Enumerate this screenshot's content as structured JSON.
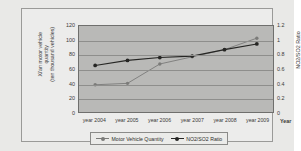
{
  "chart_data": {
    "type": "line",
    "title": "",
    "xlabel": "Year",
    "categories": [
      "year 2004",
      "year 2005",
      "year 2006",
      "year 2007",
      "year 2008",
      "year 2009"
    ],
    "grid": true,
    "legend_position": "bottom",
    "axes": {
      "left": {
        "label": "Xi'an motor vehicle quantity (ten thousand vehicles)",
        "label_lines": [
          "Xi'an motor vehicle",
          "quantity",
          "(ten thousand vehicles)"
        ],
        "ticks": [
          0,
          20,
          40,
          60,
          80,
          100,
          120
        ],
        "tick_labels": [
          "0",
          "20",
          "40",
          "60",
          "80",
          "100",
          "120"
        ],
        "ylim": [
          0,
          120
        ]
      },
      "right": {
        "label": "NO2/SO2 Ratio",
        "ticks": [
          0,
          0.2,
          0.4,
          0.6,
          0.8,
          1,
          1.2
        ],
        "tick_labels": [
          "0",
          "0.2",
          "0.4",
          "0.6",
          "0.8",
          "1",
          "1.2"
        ],
        "ylim": [
          0,
          1.2
        ]
      }
    },
    "series": [
      {
        "name": "Motor Vehicle Quantity",
        "axis": "left",
        "color": "#7b7b79",
        "marker": "circle",
        "values": [
          38,
          40,
          67,
          77,
          87,
          103
        ]
      },
      {
        "name": "NO2/SO2 Ratio",
        "axis": "right",
        "color": "#262624",
        "marker": "circle",
        "values": [
          0.65,
          0.72,
          0.76,
          0.78,
          0.87,
          0.95
        ]
      }
    ]
  },
  "legend": {
    "entries": [
      {
        "label": "Motor Vehicle Quantity",
        "color": "#7b7b79"
      },
      {
        "label": "NO2/SO2 Ratio",
        "color": "#262624"
      }
    ]
  },
  "colors": {
    "page_background": "#e9e9e7",
    "frame_background": "#ececeb",
    "plot_background": "#b9b9b7",
    "gridline": "#8e8e8c",
    "axis_text": "#3a3a38"
  }
}
